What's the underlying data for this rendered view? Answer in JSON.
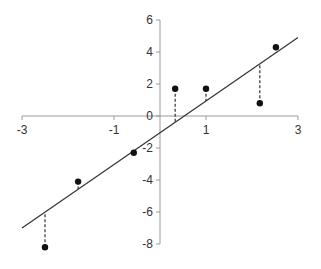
{
  "chart_data": {
    "type": "scatter",
    "title": "",
    "xlabel": "",
    "ylabel": "",
    "xlim": [
      -3,
      3
    ],
    "ylim": [
      -8,
      6
    ],
    "x_ticks": [
      "-3",
      "-1",
      "1",
      "3"
    ],
    "y_ticks": [
      "6",
      "4",
      "2",
      "0",
      "-2",
      "-4",
      "-6",
      "-8"
    ],
    "grid": false,
    "legend": null,
    "points": [
      {
        "x": -2.5,
        "y": -8.2
      },
      {
        "x": -1.78,
        "y": -4.1
      },
      {
        "x": -0.57,
        "y": -2.3
      },
      {
        "x": 0.33,
        "y": 1.7
      },
      {
        "x": 1.0,
        "y": 1.7
      },
      {
        "x": 2.17,
        "y": 0.8
      },
      {
        "x": 2.52,
        "y": 4.3
      }
    ],
    "regression_line": {
      "x1": -3,
      "y1": -7.0,
      "x2": 3,
      "y2": 4.9
    },
    "residual_lines": "dashed vertical segments from each point to the fitted line",
    "colors": {
      "axis": "#999999",
      "line": "#333333",
      "point": "#111111",
      "residual": "#333333"
    }
  }
}
